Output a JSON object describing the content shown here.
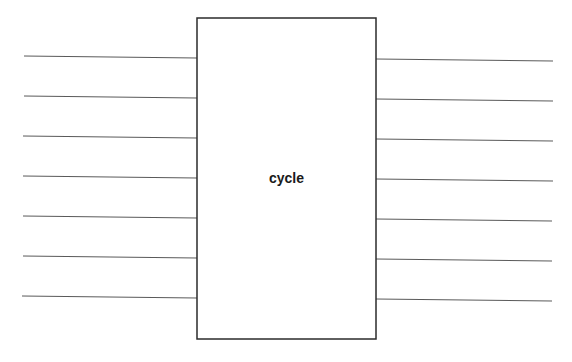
{
  "block": {
    "label": "cycle",
    "x": 197,
    "y": 18,
    "width": 179,
    "height": 321,
    "stroke": "#2b2b2b"
  },
  "inputs": [
    {
      "x1": 24,
      "y1": 56,
      "x2": 197,
      "y2": 58
    },
    {
      "x1": 24,
      "y1": 96,
      "x2": 197,
      "y2": 98
    },
    {
      "x1": 23,
      "y1": 136,
      "x2": 197,
      "y2": 138
    },
    {
      "x1": 23,
      "y1": 176,
      "x2": 197,
      "y2": 178
    },
    {
      "x1": 23,
      "y1": 216,
      "x2": 197,
      "y2": 218
    },
    {
      "x1": 23,
      "y1": 256,
      "x2": 197,
      "y2": 258
    },
    {
      "x1": 22,
      "y1": 296,
      "x2": 197,
      "y2": 298
    }
  ],
  "outputs": [
    {
      "x1": 376,
      "y1": 59,
      "x2": 553,
      "y2": 61
    },
    {
      "x1": 376,
      "y1": 99,
      "x2": 553,
      "y2": 101
    },
    {
      "x1": 376,
      "y1": 139,
      "x2": 553,
      "y2": 141
    },
    {
      "x1": 376,
      "y1": 179,
      "x2": 553,
      "y2": 181
    },
    {
      "x1": 376,
      "y1": 219,
      "x2": 552,
      "y2": 221
    },
    {
      "x1": 376,
      "y1": 259,
      "x2": 552,
      "y2": 261
    },
    {
      "x1": 376,
      "y1": 299,
      "x2": 552,
      "y2": 301
    }
  ]
}
